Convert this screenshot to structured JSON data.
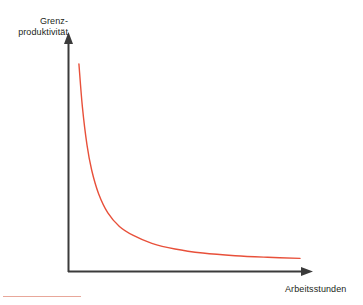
{
  "chart_data": {
    "type": "line",
    "title": "",
    "subtitle": "",
    "xlabel": "Arbeitsstunden",
    "ylabel_line1": "Grenz-",
    "ylabel_line2": "produktivität",
    "ylabel": "Grenzproduktivität",
    "grid": false,
    "legend": null,
    "axis_color": "#3b3b3b",
    "curve_color": "#e8503a",
    "underline_color": "#e8a79a",
    "xlim": [
      0,
      10
    ],
    "ylim": [
      0,
      10
    ],
    "x_ticks": [],
    "y_ticks": [],
    "annotations": [],
    "series": [
      {
        "name": "Grenzproduktivität",
        "color": "#e8503a",
        "x": [
          0.45,
          0.6,
          0.8,
          1.0,
          1.3,
          1.7,
          2.2,
          2.8,
          3.6,
          4.6,
          5.8,
          7.2,
          8.6,
          10.0
        ],
        "y": [
          9.2,
          7.3,
          5.6,
          4.5,
          3.45,
          2.6,
          2.0,
          1.6,
          1.25,
          1.0,
          0.82,
          0.7,
          0.63,
          0.58
        ]
      }
    ]
  },
  "figure": {
    "xaxis_label": "Arbeitsstunden",
    "yaxis_label_line1": "Grenz-",
    "yaxis_label_line2": "produktivität"
  }
}
